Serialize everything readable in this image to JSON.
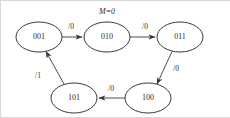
{
  "diagram": {
    "kind": "state-transition-diagram",
    "machine_label": "M=0",
    "canvas": {
      "width": 230,
      "height": 118,
      "background": "#ffffff"
    },
    "stroke_color": "#3a3a3a",
    "text_color": "#2b2b2b",
    "states": [
      {
        "id": "s001",
        "label": "001",
        "cx": 39,
        "cy": 37,
        "rx": 23,
        "ry": 15
      },
      {
        "id": "s010",
        "label": "010",
        "cx": 107,
        "cy": 37,
        "rx": 23,
        "ry": 15
      },
      {
        "id": "s011",
        "label": "011",
        "cx": 180,
        "cy": 37,
        "rx": 23,
        "ry": 15
      },
      {
        "id": "s100",
        "label": "100",
        "cx": 148,
        "cy": 98,
        "rx": 23,
        "ry": 15
      },
      {
        "id": "s101",
        "label": "101",
        "cx": 74,
        "cy": 98,
        "rx": 23,
        "ry": 15
      }
    ],
    "transitions": [
      {
        "id": "t1",
        "from": "001",
        "to": "010",
        "label": "/0",
        "label_x": 71,
        "label_y": 27
      },
      {
        "id": "t2",
        "from": "010",
        "to": "011",
        "label": "/0",
        "label_x": 145,
        "label_y": 27
      },
      {
        "id": "t3",
        "from": "011",
        "to": "100",
        "label": "/0",
        "label_x": 176,
        "label_y": 69
      },
      {
        "id": "t4",
        "from": "100",
        "to": "101",
        "label": "/0",
        "label_x": 111,
        "label_y": 89
      },
      {
        "id": "t5",
        "from": "101",
        "to": "001",
        "label": "/1",
        "label_x": 38,
        "label_y": 76
      }
    ]
  }
}
